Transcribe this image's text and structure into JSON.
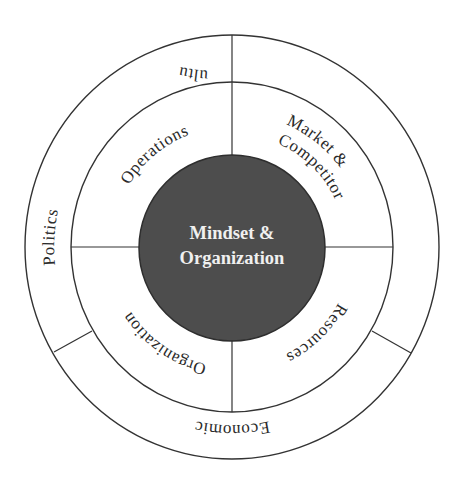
{
  "diagram": {
    "center": {
      "line1": "Mindset &",
      "line2": "Organization"
    },
    "inner_ring": {
      "segments": [
        {
          "label": "Operations",
          "position": "top-left"
        },
        {
          "label_line1": "Market &",
          "label_line2": "Competitor",
          "position": "top-right"
        },
        {
          "label": "Resources",
          "position": "bottom-right"
        },
        {
          "label": "Organization",
          "position": "bottom-left"
        }
      ]
    },
    "outer_ring": {
      "segments": [
        {
          "label": "Politics",
          "position": "left"
        },
        {
          "label": "Culture",
          "position": "right"
        },
        {
          "label": "Economic",
          "position": "bottom"
        }
      ]
    },
    "colors": {
      "line": "#333333",
      "core_fill": "#4d4d4d",
      "core_text": "#f0f0f0",
      "label_text": "#2a2a2a",
      "background": "#ffffff"
    }
  }
}
